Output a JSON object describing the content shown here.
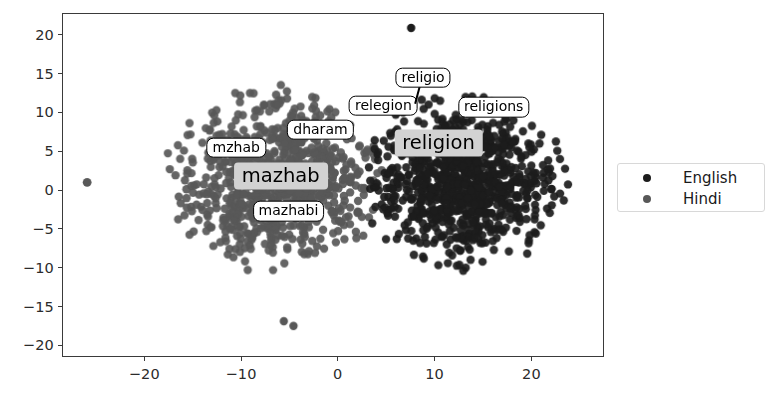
{
  "chart_data": {
    "type": "scatter",
    "title": "",
    "xlabel": "",
    "ylabel": "",
    "xlim": [
      -28.5,
      27.5
    ],
    "ylim": [
      -21.5,
      22.8
    ],
    "grid": false,
    "legend_position": "right",
    "xticks": [
      "-20",
      "-10",
      "0",
      "10",
      "20"
    ],
    "xtick_values": [
      -20,
      -10,
      0,
      10,
      20
    ],
    "yticks": [
      "20",
      "15",
      "10",
      "5",
      "0",
      "-5",
      "-10",
      "-15",
      "-20"
    ],
    "ytick_values": [
      20,
      15,
      10,
      5,
      0,
      -5,
      -10,
      -15,
      -20
    ],
    "series": [
      {
        "name": "English",
        "color": "#1c1c1c",
        "marker": "circle",
        "point_count": 900,
        "cluster_center": [
          13.0,
          1.0
        ],
        "cluster_spread": [
          7.2,
          8.0
        ]
      },
      {
        "name": "Hindi",
        "color": "#585858",
        "marker": "circle",
        "point_count": 900,
        "cluster_center": [
          -6.5,
          1.5
        ],
        "cluster_spread": [
          7.6,
          8.4
        ]
      }
    ],
    "annotations": [
      {
        "text": "mzhab",
        "x": -10.6,
        "y": 5.6,
        "style": "boxed",
        "leader": null
      },
      {
        "text": "dharam",
        "x": -1.9,
        "y": 7.9,
        "style": "boxed",
        "leader": null
      },
      {
        "text": "mazhab",
        "x": -6.0,
        "y": 1.9,
        "style": "filled",
        "leader": null
      },
      {
        "text": "mazhabi",
        "x": -5.2,
        "y": -2.6,
        "style": "boxed",
        "leader": null
      },
      {
        "text": "relegion",
        "x": 4.6,
        "y": 11.0,
        "style": "boxed",
        "leader": null
      },
      {
        "text": "religio",
        "x": 8.7,
        "y": 14.6,
        "style": "boxed",
        "leader": {
          "x": 8.0,
          "y": 11.3
        }
      },
      {
        "text": "religions",
        "x": 16.0,
        "y": 10.8,
        "style": "boxed",
        "leader": null
      },
      {
        "text": "religion",
        "x": 10.3,
        "y": 6.2,
        "style": "filled",
        "leader": null
      }
    ]
  }
}
